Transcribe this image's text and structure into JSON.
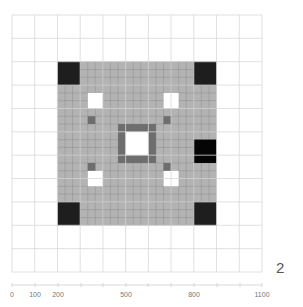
{
  "figure": {
    "panel_label": "2",
    "grid": {
      "cols": 11,
      "rows": 11,
      "left": 12,
      "top": 15,
      "width": 250,
      "height": 257,
      "line_color": "#d8d8d8",
      "subdivisions": 3
    },
    "shaded_region": {
      "col_start": 2,
      "row_start": 2,
      "cols": 7,
      "rows": 7,
      "fill": "#b3b3b3",
      "subgrid_color": "#8e8e8e"
    },
    "cells": [
      {
        "name": "corner-top-left",
        "col": 2,
        "row": 2,
        "fill": "#1e1e1e"
      },
      {
        "name": "corner-top-right",
        "col": 8,
        "row": 2,
        "fill": "#1e1e1e"
      },
      {
        "name": "corner-bottom-left",
        "col": 2,
        "row": 8,
        "fill": "#1e1e1e"
      },
      {
        "name": "corner-bottom-right",
        "col": 8,
        "row": 8,
        "fill": "#1e1e1e"
      },
      {
        "name": "right-middle",
        "col": 8,
        "row": 5.333,
        "fill": "#050505"
      },
      {
        "name": "hole-top-left",
        "col": 3.333,
        "row": 3.333,
        "w": 0.667,
        "h": 0.667,
        "fill": "#ffffff"
      },
      {
        "name": "hole-top-right",
        "col": 6.667,
        "row": 3.333,
        "w": 0.667,
        "h": 0.667,
        "fill": "#ffffff"
      },
      {
        "name": "hole-bottom-left",
        "col": 3.333,
        "row": 6.667,
        "w": 0.667,
        "h": 0.667,
        "fill": "#ffffff"
      },
      {
        "name": "hole-bottom-right",
        "col": 6.667,
        "row": 6.667,
        "w": 0.667,
        "h": 0.667,
        "fill": "#ffffff"
      },
      {
        "name": "dark-ring-center",
        "col": 4.667,
        "row": 4.667,
        "w": 1.667,
        "h": 1.667,
        "fill": "#6e6e6e"
      },
      {
        "name": "hole-center",
        "col": 5.0,
        "row": 5.0,
        "w": 1.0,
        "h": 1.0,
        "fill": "#ffffff"
      },
      {
        "name": "small-top-left",
        "col": 3.333,
        "row": 4.333,
        "w": 0.333,
        "h": 0.333,
        "fill": "#6e6e6e"
      },
      {
        "name": "small-top-right",
        "col": 6.667,
        "row": 4.333,
        "w": 0.333,
        "h": 0.333,
        "fill": "#6e6e6e"
      },
      {
        "name": "small-bottom-left",
        "col": 3.333,
        "row": 6.333,
        "w": 0.333,
        "h": 0.333,
        "fill": "#6e6e6e"
      },
      {
        "name": "small-bottom-right",
        "col": 6.667,
        "row": 6.333,
        "w": 0.333,
        "h": 0.333,
        "fill": "#6e6e6e"
      }
    ],
    "axis": {
      "y": 285,
      "line_color": "#cfcfcf",
      "tick_labels": [
        {
          "text": "0",
          "x": 12
        },
        {
          "text": "100",
          "x": 35
        },
        {
          "text": "200",
          "x": 58
        },
        {
          "text": "500",
          "x": 126
        },
        {
          "text": "800",
          "x": 194
        },
        {
          "text": "1100",
          "x": 262
        }
      ],
      "ticks_x": [
        12,
        35,
        58,
        81,
        103,
        126,
        148,
        171,
        194,
        217,
        240,
        262
      ]
    }
  }
}
